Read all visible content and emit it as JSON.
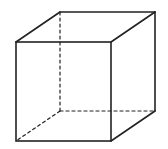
{
  "diagram": {
    "type": "wireframe-cube",
    "stroke_color": "#222222",
    "background": "#ffffff",
    "vertices": {
      "front_top_left": [
        16,
        42
      ],
      "front_top_right": [
        111,
        42
      ],
      "front_bottom_left": [
        16,
        141
      ],
      "front_bottom_right": [
        111,
        141
      ],
      "back_top_left": [
        60,
        12
      ],
      "back_top_right": [
        155,
        12
      ],
      "back_bottom_left": [
        60,
        111
      ],
      "back_bottom_right": [
        155,
        111
      ]
    },
    "visible_edges": 9,
    "hidden_edges": 3
  }
}
